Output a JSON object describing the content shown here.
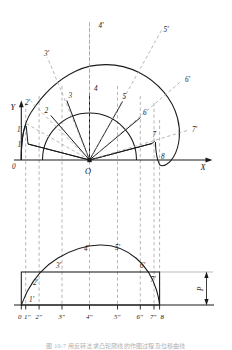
{
  "figure": {
    "axes": {
      "x_label": "X",
      "y_label": "Y",
      "origin_label": "O"
    },
    "upper_diagram": {
      "name": "radial-construction",
      "inner_arc_labels": [
        "1",
        "2",
        "3",
        "4",
        "5",
        "6",
        "7",
        "8"
      ],
      "outer_arc_labels": [
        "1'",
        "2'",
        "3'",
        "4'",
        "5'",
        "6'",
        "7'"
      ],
      "origin_label": "0",
      "end_label": "8",
      "divisions": 8,
      "inner_radius": 47,
      "outer_radius": 86,
      "radial_line_count": 9
    },
    "lower_diagram": {
      "name": "displacement-diagram",
      "curve_point_labels": [
        "1'",
        "2'",
        "3'",
        "4'",
        "5'",
        "6'",
        "7'"
      ],
      "tick_labels": [
        "0",
        "1\"",
        "2\"",
        "3\"",
        "4\"",
        "5\"",
        "6\"",
        "7\"",
        "8"
      ],
      "dimension_label": "P"
    },
    "caption": "图 10-7   用反转法求凸轮廓线的作图过程及位移曲线",
    "colors": {
      "stroke": "#1a1a1a",
      "dashed": "#9a9a9a",
      "background": "#ffffff"
    }
  }
}
